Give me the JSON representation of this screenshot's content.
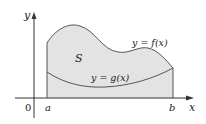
{
  "diagram": {
    "axes": {
      "x_label": "x",
      "y_label": "y",
      "origin_label": "0"
    },
    "bounds": {
      "a_label": "a",
      "b_label": "b"
    },
    "region_label": "S",
    "curves": {
      "upper": "y = f(x)",
      "lower": "y = g(x)"
    },
    "colors": {
      "fill": "#e3e3e3",
      "curve": "#555555",
      "axis": "#333333"
    }
  }
}
